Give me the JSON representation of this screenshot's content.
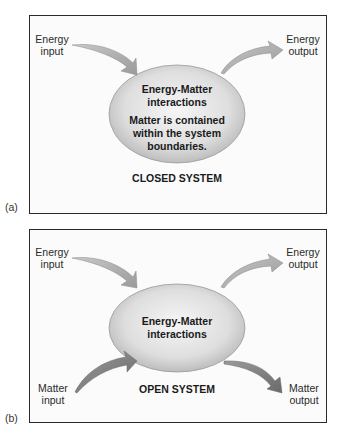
{
  "colors": {
    "energy_arrow": "#a8a8a8",
    "matter_arrow": "#7a7a7a",
    "ellipse_center": "#f4f4f4",
    "ellipse_edge": "#c4c4c4",
    "border": "#2a2a2a"
  },
  "panel_a": {
    "label": "(a)",
    "energy_input": [
      "Energy",
      "input"
    ],
    "energy_output": [
      "Energy",
      "output"
    ],
    "ellipse_title": [
      "Energy-Matter",
      "interactions"
    ],
    "ellipse_note": [
      "Matter is contained",
      "within the system",
      "boundaries."
    ],
    "system_title": "CLOSED SYSTEM"
  },
  "panel_b": {
    "label": "(b)",
    "energy_input": [
      "Energy",
      "input"
    ],
    "energy_output": [
      "Energy",
      "output"
    ],
    "matter_input": [
      "Matter",
      "input"
    ],
    "matter_output": [
      "Matter",
      "output"
    ],
    "ellipse_title": [
      "Energy-Matter",
      "interactions"
    ],
    "system_title": "OPEN SYSTEM"
  }
}
